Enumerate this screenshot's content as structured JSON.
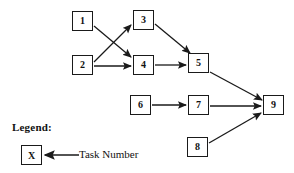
{
  "diagram": {
    "type": "task-precedence-network",
    "nodes": [
      {
        "id": "n1",
        "label": "1",
        "x": 72,
        "y": 11
      },
      {
        "id": "n2",
        "label": "2",
        "x": 72,
        "y": 55
      },
      {
        "id": "n3",
        "label": "3",
        "x": 133,
        "y": 10
      },
      {
        "id": "n4",
        "label": "4",
        "x": 133,
        "y": 55
      },
      {
        "id": "n5",
        "label": "5",
        "x": 188,
        "y": 53
      },
      {
        "id": "n6",
        "label": "6",
        "x": 130,
        "y": 95
      },
      {
        "id": "n7",
        "label": "7",
        "x": 188,
        "y": 95
      },
      {
        "id": "n8",
        "label": "8",
        "x": 187,
        "y": 137
      },
      {
        "id": "n9",
        "label": "9",
        "x": 263,
        "y": 95
      }
    ],
    "edges": [
      {
        "from": "1",
        "to": "4",
        "x1": 94,
        "y1": 26,
        "x2": 131,
        "y2": 57
      },
      {
        "from": "2",
        "to": "3",
        "x1": 94,
        "y1": 62,
        "x2": 131,
        "y2": 25
      },
      {
        "from": "2",
        "to": "4",
        "x1": 94,
        "y1": 66,
        "x2": 131,
        "y2": 66
      },
      {
        "from": "3",
        "to": "5",
        "x1": 155,
        "y1": 24,
        "x2": 190,
        "y2": 53
      },
      {
        "from": "4",
        "to": "5",
        "x1": 155,
        "y1": 65,
        "x2": 186,
        "y2": 65
      },
      {
        "from": "5",
        "to": "9",
        "x1": 210,
        "y1": 72,
        "x2": 262,
        "y2": 100
      },
      {
        "from": "6",
        "to": "7",
        "x1": 152,
        "y1": 105,
        "x2": 186,
        "y2": 105
      },
      {
        "from": "7",
        "to": "9",
        "x1": 210,
        "y1": 106,
        "x2": 261,
        "y2": 106
      },
      {
        "from": "8",
        "to": "9",
        "x1": 209,
        "y1": 143,
        "x2": 261,
        "y2": 113
      }
    ]
  },
  "legend": {
    "title": "Legend:",
    "symbol": "X",
    "label": "Task Number",
    "pointer": {
      "tip_x": 45,
      "tail_x": 79,
      "y": 155
    }
  },
  "colors": {
    "stroke": "#1a1a1a",
    "background": "#ffffff",
    "text": "#111111"
  }
}
